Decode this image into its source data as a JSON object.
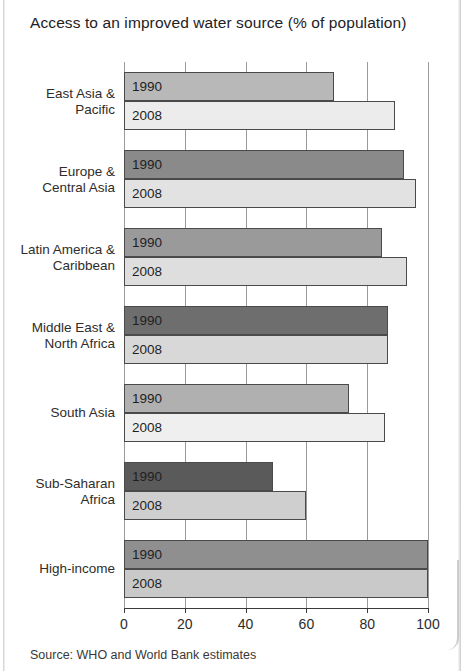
{
  "chart_data": {
    "type": "bar",
    "orientation": "horizontal",
    "title": "Access to an improved water source (% of population)",
    "xlabel": "",
    "ylabel": "",
    "xlim": [
      0,
      100
    ],
    "xticks": [
      0,
      20,
      40,
      60,
      80,
      100
    ],
    "xtick_labels": [
      "0",
      "20",
      "40",
      "60",
      "80",
      "100"
    ],
    "grid": true,
    "grid_axis": "x",
    "legend": "inline-bar-labels",
    "categories": [
      "East Asia &\nPacific",
      "Europe &\nCentral Asia",
      "Latin America &\nCaribbean",
      "Middle East &\nNorth Africa",
      "South Asia",
      "Sub-Saharan\nAfrica",
      "High-income"
    ],
    "series": [
      {
        "name": "1990",
        "color": "#8f8f8f",
        "values": [
          69,
          92,
          85,
          87,
          74,
          49,
          100
        ]
      },
      {
        "name": "2008",
        "color": "#dedede",
        "values": [
          89,
          96,
          93,
          87,
          86,
          60,
          100
        ]
      }
    ],
    "bar_colors_1990": [
      "#b8b8b8",
      "#8a8a8a",
      "#9a9a9a",
      "#6e6e6e",
      "#b0b0b0",
      "#5a5a5a",
      "#8f8f8f"
    ],
    "bar_colors_2008": [
      "#ececec",
      "#e2e2e2",
      "#dedede",
      "#d8d8d8",
      "#efefef",
      "#cfcfcf",
      "#c9c9c9"
    ],
    "source": "Source: WHO and World Bank estimates"
  }
}
